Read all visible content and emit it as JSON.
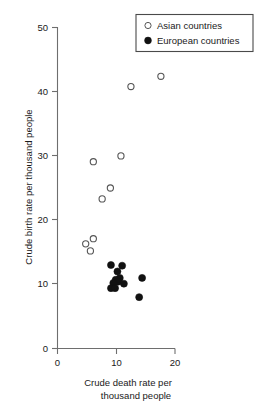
{
  "chart_data": {
    "type": "scatter",
    "title": "",
    "xlabel": "Crude death rate per thousand people",
    "xlabel_line1": "Crude death rate per",
    "xlabel_line2": "thousand people",
    "ylabel": "Crude birth rate per thousand people",
    "xlim": [
      0,
      20
    ],
    "ylim": [
      0,
      50
    ],
    "xticks": [
      0,
      10,
      20
    ],
    "xtick_labels": [
      "0",
      "10",
      "20"
    ],
    "yticks": [
      0,
      10,
      20,
      30,
      40,
      50
    ],
    "ytick_labels": [
      "0",
      "10",
      "20",
      "30",
      "40",
      "50"
    ],
    "grid": false,
    "legend_position": "top-right",
    "series": [
      {
        "name": "Asian countries",
        "marker": "open-circle",
        "color": "#ffffff",
        "edge_color": "#555555",
        "points": [
          {
            "x": 17.6,
            "y": 42.4
          },
          {
            "x": 12.5,
            "y": 40.8
          },
          {
            "x": 10.8,
            "y": 30.0
          },
          {
            "x": 9.0,
            "y": 25.0
          },
          {
            "x": 7.6,
            "y": 23.3
          },
          {
            "x": 6.1,
            "y": 29.1
          },
          {
            "x": 6.1,
            "y": 17.1
          },
          {
            "x": 4.8,
            "y": 16.3
          },
          {
            "x": 5.6,
            "y": 15.2
          }
        ]
      },
      {
        "name": "European countries",
        "marker": "filled-circle",
        "color": "#111111",
        "edge_color": "#111111",
        "points": [
          {
            "x": 9.1,
            "y": 13.0
          },
          {
            "x": 11.0,
            "y": 12.9
          },
          {
            "x": 10.2,
            "y": 12.0
          },
          {
            "x": 10.6,
            "y": 11.0
          },
          {
            "x": 9.9,
            "y": 10.7
          },
          {
            "x": 10.3,
            "y": 10.4
          },
          {
            "x": 9.5,
            "y": 10.2
          },
          {
            "x": 11.3,
            "y": 10.1
          },
          {
            "x": 9.1,
            "y": 9.4
          },
          {
            "x": 9.8,
            "y": 9.4
          },
          {
            "x": 14.4,
            "y": 11.0
          },
          {
            "x": 13.9,
            "y": 8.0
          }
        ]
      }
    ]
  },
  "legend": {
    "entries": [
      {
        "label": "Asian countries",
        "marker": "open-circle"
      },
      {
        "label": "European countries",
        "marker": "filled-circle"
      }
    ]
  }
}
